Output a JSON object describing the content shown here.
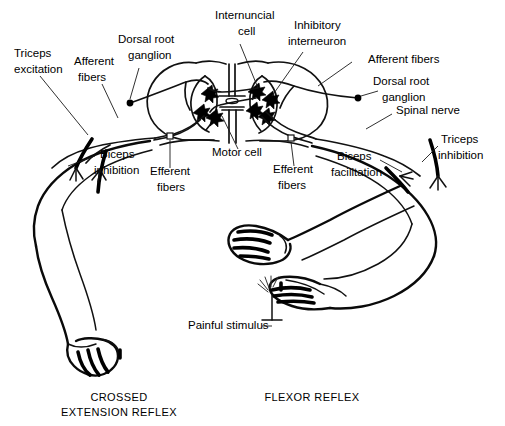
{
  "figure": {
    "background_color": "#ffffff",
    "ink_color": "#000000"
  },
  "labels": {
    "triceps_excitation": "Triceps\nexcitation",
    "triceps_excitation_l1": "Triceps",
    "triceps_excitation_l2": "excitation",
    "afferent_fibers_left_l1": "Afferent",
    "afferent_fibers_left_l2": "fibers",
    "dorsal_root_ganglion_left_l1": "Dorsal root",
    "dorsal_root_ganglion_left_l2": "ganglion",
    "internuncial_cell_l1": "Internuncial",
    "internuncial_cell_l2": "cell",
    "inhibitory_interneuron_l1": "Inhibitory",
    "inhibitory_interneuron_l2": "interneuron",
    "afferent_fibers_right": "Afferent fibers",
    "dorsal_root_ganglion_right_l1": "Dorsal root",
    "dorsal_root_ganglion_right_l2": "ganglion",
    "spinal_nerve": "Spinal nerve",
    "triceps_inhibition_l1": "Triceps",
    "triceps_inhibition_l2": "inhibition",
    "biceps_inhibition_l1": "Biceps",
    "biceps_inhibition_l2": "inhibition",
    "efferent_fibers_left_l1": "Efferent",
    "efferent_fibers_left_l2": "fibers",
    "motor_cell": "Motor cell",
    "efferent_fibers_right_l1": "Efferent",
    "efferent_fibers_right_l2": "fibers",
    "biceps_facilitation_l1": "Biceps",
    "biceps_facilitation_l2": "facilitation",
    "painful_stimulus": "Painful stimulus"
  },
  "captions": {
    "left_l1": "CROSSED",
    "left_l2": "EXTENSION REFLEX",
    "right_l1": "FLEXOR REFLEX"
  },
  "icons": {
    "ganglion": "ganglion-dot",
    "neuron": "neuron-cell-body",
    "stimulus": "pain-burst-icon"
  }
}
